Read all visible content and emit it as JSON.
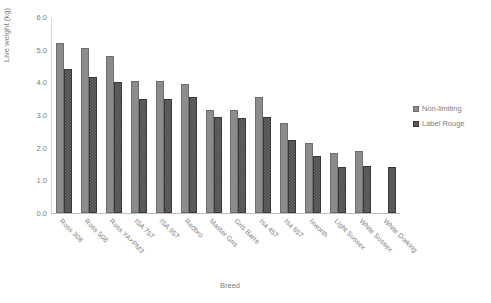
{
  "chart_data": {
    "type": "bar",
    "title": "",
    "xlabel": "Breed",
    "ylabel": "Live weight (kg)",
    "ylim": [
      0.0,
      6.0
    ],
    "ytick_step": 1.0,
    "yticks": [
      "6.0",
      "5.0",
      "4.0",
      "3.0",
      "2.0",
      "1.0",
      "0.0"
    ],
    "grid": false,
    "legend_position": "right",
    "categories": [
      "Ross 308",
      "Ross 508",
      "Ross YA×PM3",
      "ISA 757",
      "ISA 957",
      "Redbro",
      "Master Gris",
      "Gris Barre",
      "Isa 457",
      "Isa 657",
      "Ixworth",
      "Light Sussex",
      "White Sussex",
      "White Dorking"
    ],
    "series": [
      {
        "name": "Non-limiting",
        "color": "#8c8c8c",
        "values": [
          5.2,
          5.05,
          4.8,
          4.05,
          4.05,
          3.95,
          3.15,
          3.15,
          3.55,
          2.75,
          2.15,
          1.85,
          1.9,
          null
        ]
      },
      {
        "name": "Label Rouge",
        "color": "#4f4f4f",
        "values": [
          4.4,
          4.15,
          4.0,
          3.5,
          3.5,
          3.55,
          2.95,
          2.9,
          2.95,
          2.25,
          1.75,
          1.4,
          1.45,
          1.4
        ]
      }
    ]
  },
  "legend": {
    "items": [
      {
        "label": "Non-limiting"
      },
      {
        "label": "Label Rouge"
      }
    ]
  }
}
